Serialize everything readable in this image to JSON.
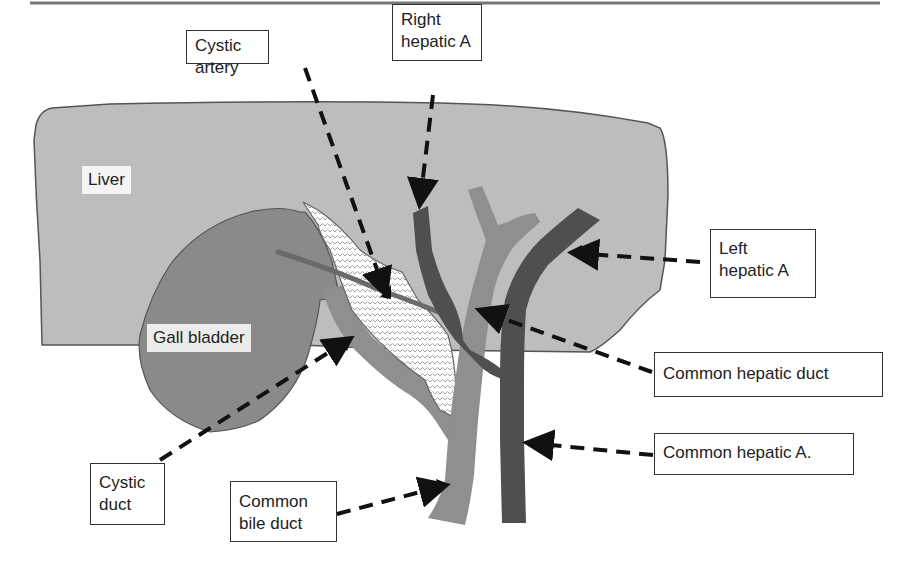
{
  "figure": {
    "type": "anatomical-diagram"
  },
  "colors": {
    "liver": "#bdbdbd",
    "gall_bladder": "#8a8a8a",
    "bile_ducts": "#8f8f8f",
    "arteries": "#4f4f4f",
    "outline": "#555555",
    "hatch_fill": "#ffffff",
    "hatch_line": "#9a9a9a",
    "arrows": "#111111",
    "top_rule": "#777777"
  },
  "labels": {
    "liver": "Liver",
    "gall_bladder": "Gall bladder",
    "cystic_artery": "Cystic artery",
    "right_hepatic_a_line1": "Right",
    "right_hepatic_a_line2": "hepatic A",
    "left_hepatic_a_line1": "Left",
    "left_hepatic_a_line2": "hepatic A",
    "common_hepatic_duct": "Common hepatic duct",
    "common_hepatic_a": "Common hepatic A.",
    "cystic_duct_line1": "Cystic",
    "cystic_duct_line2": "duct",
    "common_bile_duct_line1": "Common",
    "common_bile_duct_line2": "bile duct"
  }
}
